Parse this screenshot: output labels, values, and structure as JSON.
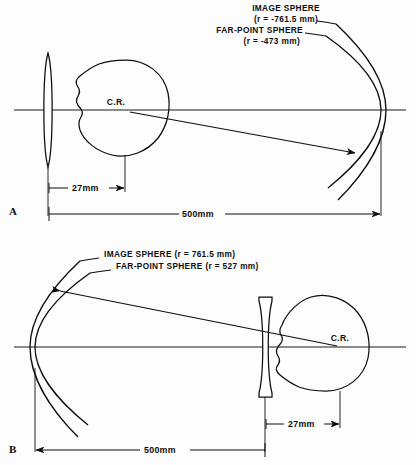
{
  "figure": {
    "background_color": "#fdfdfd",
    "ink_color": "#0d0d0d"
  },
  "panels": [
    {
      "id": "A",
      "marker": "A",
      "description": "Plus (convex) spectacle lens correcting a hyperopic eye; spheres curve toward the eye with negative radii",
      "lens_type": "biconvex",
      "labels": {
        "image_sphere_line1": "IMAGE SPHERE",
        "image_sphere_line2": "(r = -761.5 mm)",
        "far_point_line1": "FAR-POINT SPHERE",
        "far_point_line2": "(r = -473 mm)",
        "center_of_rotation": "C.R."
      },
      "dimensions": [
        {
          "name": "vertex-distance",
          "value": "27mm"
        },
        {
          "name": "sphere-distance",
          "value": "500mm"
        }
      ]
    },
    {
      "id": "B",
      "marker": "B",
      "description": "Minus (concave) spectacle lens correcting a myopic eye; spheres curve away from the eye with positive radii",
      "lens_type": "biconcave",
      "labels": {
        "image_sphere": "IMAGE SPHERE (r = 761.5 mm)",
        "far_point": "FAR-POINT SPHERE  (r = 527 mm)",
        "center_of_rotation": "C.R."
      },
      "dimensions": [
        {
          "name": "vertex-distance",
          "value": "27mm"
        },
        {
          "name": "sphere-distance",
          "value": "500mm"
        }
      ]
    }
  ]
}
